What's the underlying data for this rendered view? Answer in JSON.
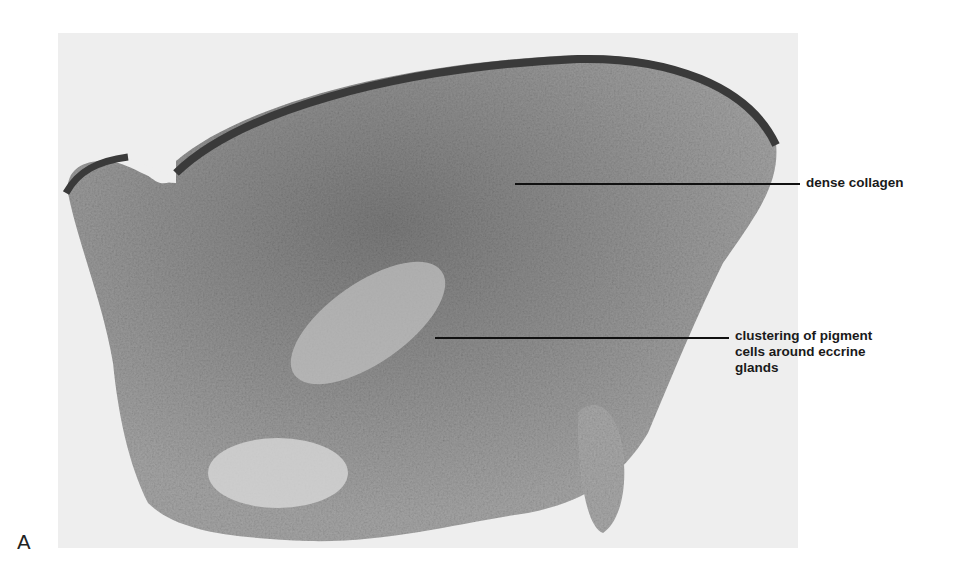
{
  "figure": {
    "panel_letter": "A",
    "photo": {
      "description": "grayscale histology micrograph of skin section",
      "background_color": "#eeeeee",
      "tissue_color": "#9a9a9a",
      "epidermis_color": "#3a3a3a"
    },
    "annotations": [
      {
        "text": "dense collagen"
      },
      {
        "line1": "clustering of pigment",
        "line2": "cells around eccrine",
        "line3": "glands"
      }
    ]
  }
}
